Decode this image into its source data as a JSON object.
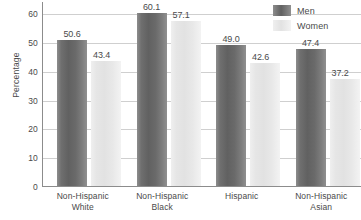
{
  "chart_data": {
    "type": "bar",
    "title": "",
    "xlabel": "",
    "ylabel": "Percentage",
    "ylim": [
      0,
      60
    ],
    "yticks": [
      0,
      10,
      20,
      30,
      40,
      50,
      60
    ],
    "ytick_labels": [
      "0",
      "10",
      "20",
      "30",
      "40",
      "50",
      "60"
    ],
    "grid": true,
    "legend_position": "top-right",
    "categories": [
      "Non-Hispanic White",
      "Non-Hispanic Black",
      "Hispanic",
      "Non-Hispanic Asian"
    ],
    "category_lines": [
      [
        "Non-Hispanic",
        "White"
      ],
      [
        "Non-Hispanic",
        "Black"
      ],
      [
        "Hispanic",
        ""
      ],
      [
        "Non-Hispanic",
        "Asian"
      ]
    ],
    "series": [
      {
        "name": "Men",
        "color": "#6a6a6a",
        "values": [
          50.6,
          60.1,
          49.0,
          47.4
        ],
        "value_labels": [
          "50.6",
          "60.1",
          "49.0",
          "47.4"
        ]
      },
      {
        "name": "Women",
        "color": "#e6e6e6",
        "values": [
          43.4,
          57.1,
          42.6,
          37.2
        ],
        "value_labels": [
          "43.4",
          "57.1",
          "42.6",
          "37.2"
        ]
      }
    ]
  },
  "legend": {
    "items": [
      {
        "label": "Men"
      },
      {
        "label": "Women"
      }
    ]
  },
  "colors": {
    "men_bar": "#6a6a6a",
    "women_bar": "#e6e6e6",
    "gridline": "#cfcfcf",
    "axis": "#8c8c8c",
    "text": "#4a4a4a",
    "background": "#ffffff"
  }
}
